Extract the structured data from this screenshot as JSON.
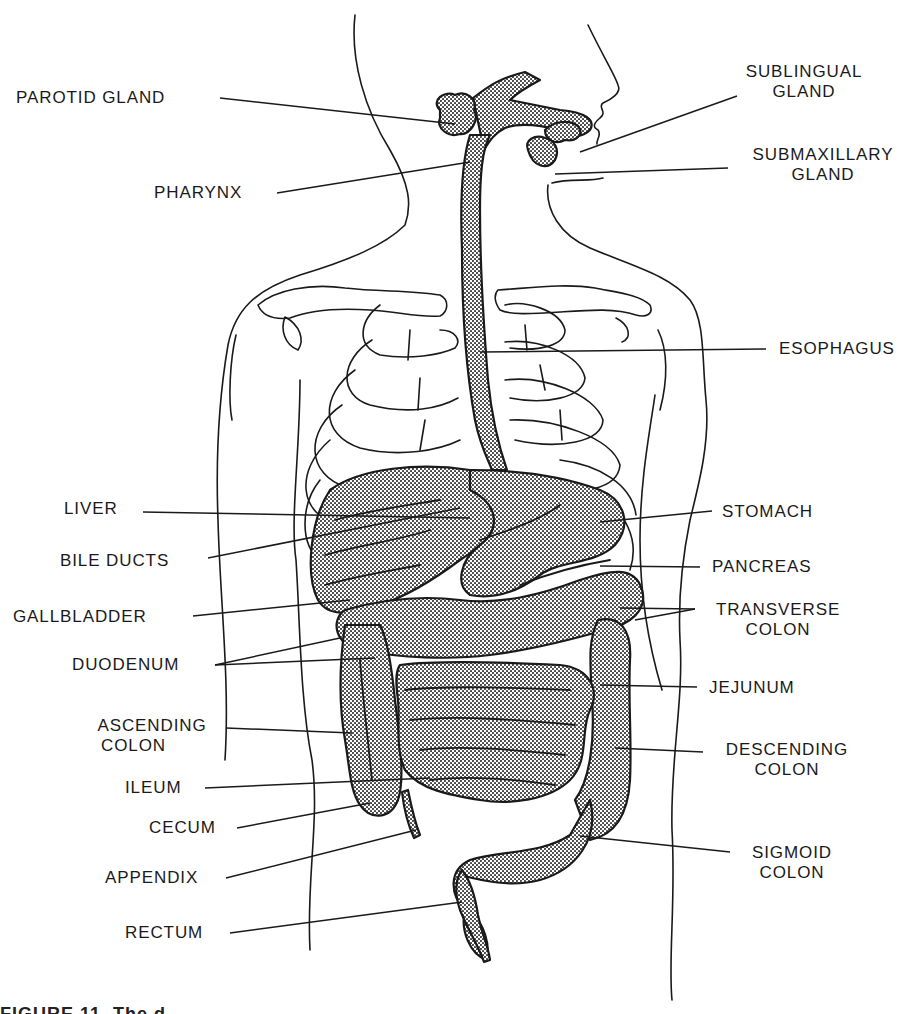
{
  "figure": {
    "style": "black line art with stippled (dotted) organ fill",
    "colors": {
      "ink": "#1a1a1a",
      "fill_pattern": "#6b6b6b",
      "background": "#ffffff"
    },
    "caption_partial": "FIGURE 11. The d"
  },
  "labels": {
    "left": [
      {
        "id": "parotid-gland",
        "text": "PAROTID GLAND"
      },
      {
        "id": "pharynx",
        "text": "PHARYNX"
      },
      {
        "id": "liver",
        "text": "LIVER"
      },
      {
        "id": "bile-ducts",
        "text": "BILE DUCTS"
      },
      {
        "id": "gallbladder",
        "text": "GALLBLADDER"
      },
      {
        "id": "duodenum",
        "text": "DUODENUM"
      },
      {
        "id": "ascending-colon",
        "line1": "ASCENDING",
        "line2": "COLON"
      },
      {
        "id": "ileum",
        "text": "ILEUM"
      },
      {
        "id": "cecum",
        "text": "CECUM"
      },
      {
        "id": "appendix",
        "text": "APPENDIX"
      },
      {
        "id": "rectum",
        "text": "RECTUM"
      }
    ],
    "right": [
      {
        "id": "sublingual-gland",
        "line1": "SUBLINGUAL",
        "line2": "GLAND"
      },
      {
        "id": "submaxillary-gland",
        "line1": "SUBMAXILLARY",
        "line2": "GLAND"
      },
      {
        "id": "esophagus",
        "text": "ESOPHAGUS"
      },
      {
        "id": "stomach",
        "text": "STOMACH"
      },
      {
        "id": "pancreas",
        "text": "PANCREAS"
      },
      {
        "id": "transverse-colon",
        "line1": "TRANSVERSE",
        "line2": "COLON"
      },
      {
        "id": "jejunum",
        "text": "JEJUNUM"
      },
      {
        "id": "descending-colon",
        "line1": "DESCENDING",
        "line2": "COLON"
      },
      {
        "id": "sigmoid-colon",
        "line1": "SIGMOID",
        "line2": "COLON"
      }
    ]
  }
}
